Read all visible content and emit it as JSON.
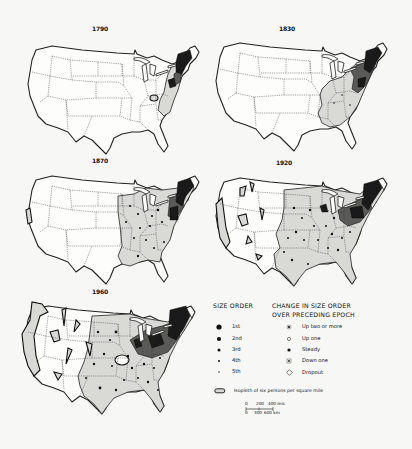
{
  "maps": [
    {
      "year": "1790"
    },
    {
      "year": "1830"
    },
    {
      "year": "1870"
    },
    {
      "year": "1920"
    },
    {
      "year": "1960"
    }
  ],
  "legend": {
    "size_order": {
      "title": "SIZE ORDER",
      "items": [
        {
          "label": "1st",
          "symbol": "large-filled-dot"
        },
        {
          "label": "2nd",
          "symbol": "medium-filled-dot"
        },
        {
          "label": "3rd",
          "symbol": "small-filled-dot"
        },
        {
          "label": "4th",
          "symbol": "tiny-filled-dot"
        },
        {
          "label": "5th",
          "symbol": "minimal-dot"
        }
      ]
    },
    "change": {
      "title_line1": "CHANGE IN SIZE ORDER",
      "title_line2": "OVER PRECEDING EPOCH",
      "items": [
        {
          "label": "Up two or more",
          "symbol": "dot-with-ring"
        },
        {
          "label": "Up one",
          "symbol": "open-circle"
        },
        {
          "label": "Steady",
          "symbol": "filled-dot"
        },
        {
          "label": "Down one",
          "symbol": "dot-in-square"
        },
        {
          "label": "Dropout",
          "symbol": "open-diamond"
        }
      ]
    },
    "isopleth": {
      "label": "Isopleth of six persons per square mile",
      "symbol": "isopleth-outline"
    },
    "scale": {
      "miles": [
        "0",
        "200",
        "400 mis"
      ],
      "km": [
        "0",
        "300",
        "600 km"
      ]
    }
  },
  "colors": {
    "background": "#f7f7f5",
    "light_shade": "#d9d9d6",
    "dark_shade": "#5a5a58",
    "ink": "#111111"
  }
}
